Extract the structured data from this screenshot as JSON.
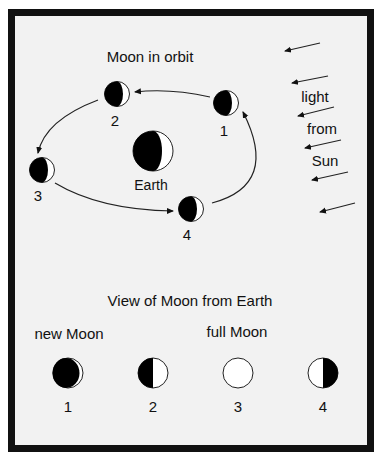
{
  "diagram": {
    "orbit_title": "Moon in orbit",
    "earth_label": "Earth",
    "orbit_moons": [
      {
        "label": "1",
        "phase_shading": "dark-left"
      },
      {
        "label": "2",
        "phase_shading": "dark-left"
      },
      {
        "label": "3",
        "phase_shading": "dark-left"
      },
      {
        "label": "4",
        "phase_shading": "dark-left"
      }
    ],
    "sunlight_labels": [
      "light",
      "from",
      "Sun"
    ],
    "view_title": "View of Moon from Earth",
    "phase_captions": {
      "new": "new Moon",
      "full": "full Moon"
    },
    "views": [
      {
        "label": "1",
        "phase": "new"
      },
      {
        "label": "2",
        "phase": "first-quarter-dark-left"
      },
      {
        "label": "3",
        "phase": "full"
      },
      {
        "label": "4",
        "phase": "last-quarter-dark-right"
      }
    ],
    "colors": {
      "frame": "#111111",
      "background": "#f2f2f2",
      "dark": "#000000",
      "light": "#ffffff"
    }
  }
}
